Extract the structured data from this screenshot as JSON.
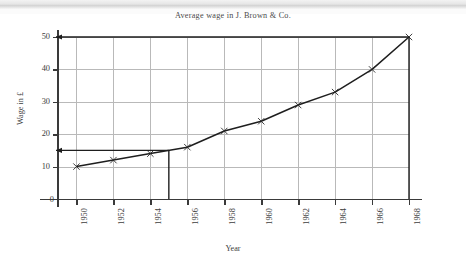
{
  "figure": {
    "title": "Average wage in J. Brown & Co.",
    "background": "#ffffff",
    "line_color": "#1e1e1e",
    "grid_color": "#b9b9b9",
    "axis_color": "#3a3a3a"
  },
  "axes": {
    "y_label": "Wage in £",
    "x_label": "Year",
    "origin_label": "0",
    "y_ticks": [
      "10",
      "20",
      "30",
      "40",
      "50"
    ],
    "x_ticks": [
      "1950",
      "1952",
      "1954",
      "1956",
      "1958",
      "1960",
      "1962",
      "1964",
      "1966",
      "1968"
    ]
  },
  "annotations": [
    {
      "name": "arrow-to-50",
      "label": "50",
      "value": 50,
      "from_year": 1968
    },
    {
      "name": "arrow-to-15",
      "label": "15",
      "value": 15,
      "from_year": 1955
    },
    {
      "name": "dropline-1955",
      "label": "1955",
      "year": 1955,
      "value": 15
    }
  ],
  "chart_data": {
    "type": "line",
    "title": "Average wage in J. Brown & Co.",
    "xlabel": "Year",
    "ylabel": "Wage in £",
    "xlim": [
      1949,
      1968
    ],
    "ylim": [
      0,
      50
    ],
    "grid": true,
    "legend": null,
    "marker": "x",
    "x": [
      1950,
      1952,
      1954,
      1956,
      1958,
      1960,
      1962,
      1964,
      1966,
      1968
    ],
    "values": [
      10,
      12,
      14,
      16,
      21,
      24,
      29,
      33,
      40,
      50
    ],
    "series": [
      {
        "name": "Average wage",
        "x": [
          1950,
          1952,
          1954,
          1956,
          1958,
          1960,
          1962,
          1964,
          1966,
          1968
        ],
        "values": [
          10,
          12,
          14,
          16,
          21,
          24,
          29,
          33,
          40,
          50
        ]
      }
    ],
    "readings": [
      {
        "year": 1955,
        "wage": 15
      },
      {
        "year": 1968,
        "wage": 50
      }
    ]
  }
}
